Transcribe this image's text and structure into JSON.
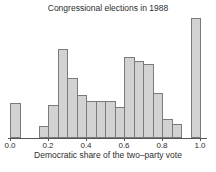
{
  "chart_data": {
    "type": "bar",
    "subtype": "histogram",
    "title": "Congressional elections in 1988",
    "xlabel": "Democratic share of the two–party vote",
    "ylabel": "",
    "y_axis_shown": false,
    "grid": false,
    "legend": "none",
    "xlim": [
      0.0,
      1.0
    ],
    "bin_width": 0.05,
    "x_ticks": [
      {
        "value": 0.0,
        "label": "0.0"
      },
      {
        "value": 0.2,
        "label": "0.2"
      },
      {
        "value": 0.4,
        "label": "0.4"
      },
      {
        "value": 0.6,
        "label": "0.6"
      },
      {
        "value": 0.8,
        "label": "0.8"
      },
      {
        "value": 1.0,
        "label": "1.0"
      }
    ],
    "bins": [
      {
        "x0": 0.0,
        "x1": 0.05,
        "count": 18
      },
      {
        "x0": 0.05,
        "x1": 0.1,
        "count": 0
      },
      {
        "x0": 0.1,
        "x1": 0.15,
        "count": 0
      },
      {
        "x0": 0.15,
        "x1": 0.2,
        "count": 6
      },
      {
        "x0": 0.2,
        "x1": 0.25,
        "count": 17
      },
      {
        "x0": 0.25,
        "x1": 0.3,
        "count": 46
      },
      {
        "x0": 0.3,
        "x1": 0.35,
        "count": 31
      },
      {
        "x0": 0.35,
        "x1": 0.4,
        "count": 22
      },
      {
        "x0": 0.4,
        "x1": 0.45,
        "count": 19
      },
      {
        "x0": 0.45,
        "x1": 0.5,
        "count": 19
      },
      {
        "x0": 0.5,
        "x1": 0.55,
        "count": 19
      },
      {
        "x0": 0.55,
        "x1": 0.6,
        "count": 16
      },
      {
        "x0": 0.6,
        "x1": 0.65,
        "count": 42
      },
      {
        "x0": 0.65,
        "x1": 0.7,
        "count": 40
      },
      {
        "x0": 0.7,
        "x1": 0.75,
        "count": 38
      },
      {
        "x0": 0.75,
        "x1": 0.8,
        "count": 23
      },
      {
        "x0": 0.8,
        "x1": 0.85,
        "count": 10
      },
      {
        "x0": 0.85,
        "x1": 0.9,
        "count": 7
      },
      {
        "x0": 0.9,
        "x1": 0.95,
        "count": 0
      },
      {
        "x0": 0.95,
        "x1": 1.0,
        "count": 62
      }
    ],
    "note_counts_estimated": true,
    "colors": {
      "bar_fill": "#d2d2d2",
      "bar_border": "#7b7b7b",
      "axis": "#555555",
      "text": "#2e2e2e",
      "background": "#ffffff"
    }
  }
}
